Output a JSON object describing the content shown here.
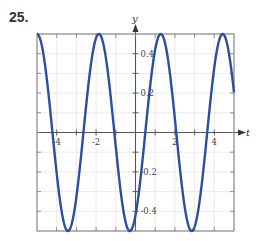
{
  "problem_number": "25.",
  "chart_data": {
    "type": "line",
    "title": "",
    "xlabel": "t",
    "ylabel": "y",
    "xlim": [
      -5,
      5
    ],
    "ylim": [
      -0.5,
      0.5
    ],
    "grid": true,
    "x_ticks": [
      -4,
      -2,
      2,
      4
    ],
    "x_tick_labels": [
      "-4",
      "-2",
      "2",
      "4"
    ],
    "y_ticks": [
      0.4,
      0.2,
      -0.2,
      -0.4
    ],
    "y_tick_labels": [
      "0.4",
      "0.2",
      "-0.2",
      "-0.4"
    ],
    "series": [
      {
        "name": "y(t)",
        "color": "#2a4ea0",
        "description": "sinusoid, amplitude 0.5, period pi, peaks at t = -5 + k*pi",
        "amplitude": 0.5,
        "period": 3.1416,
        "peak_t": [
          -5,
          -1.86,
          1.28,
          4.42
        ],
        "trough_t": [
          -3.43,
          -0.29,
          2.85
        ],
        "x": [
          -5,
          -4,
          -3,
          -2,
          -1,
          0,
          1,
          2,
          3,
          4,
          5
        ],
        "values": [
          0.5,
          -0.21,
          -0.42,
          0.48,
          0.0,
          -0.42,
          0.37,
          0.07,
          -0.49,
          0.33,
          0.2
        ]
      }
    ]
  }
}
